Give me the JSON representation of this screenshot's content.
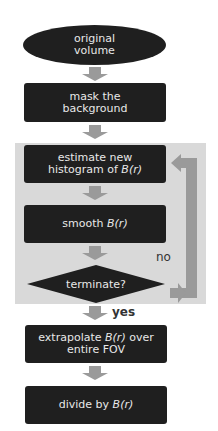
{
  "colors": {
    "node_fill": "#1f1f1f",
    "node_text": "#e8e8e8",
    "arrow": "#9a9a9a",
    "panel": "#d9d9d9",
    "label_text": "#333333"
  },
  "nodes": {
    "start": {
      "line1": "original",
      "line2": "volume"
    },
    "mask": {
      "line1": "mask the",
      "line2": "background"
    },
    "estimate": {
      "line1": "estimate new",
      "line2_prefix": "histogram of ",
      "line2_var": "B(r)"
    },
    "smooth": {
      "prefix": "smooth ",
      "var": "B(r)"
    },
    "decision": {
      "text": "terminate?"
    },
    "extrapolate": {
      "line1_prefix": "extrapolate ",
      "line1_var": "B(r)",
      "line1_suffix": " over",
      "line2": "entire FOV"
    },
    "divide": {
      "prefix": "divide by ",
      "var": "B(r)"
    }
  },
  "edges": {
    "no_label": "no",
    "yes_label": "yes"
  }
}
